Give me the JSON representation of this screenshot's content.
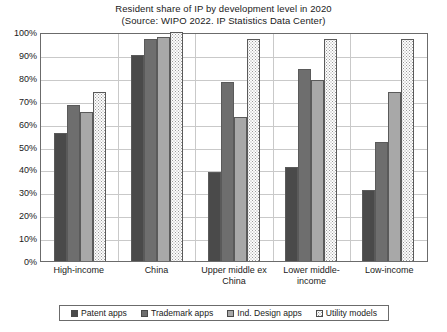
{
  "chart_data": {
    "type": "bar",
    "title": "Resident share of IP by development level in 2020",
    "subtitle": "(Source: WIPO 2022. IP Statistics Data Center)",
    "xlabel": "",
    "ylabel": "",
    "ylim": [
      0,
      100
    ],
    "grid": true,
    "legend_position": "bottom",
    "categories": [
      "High-income",
      "China",
      "Upper middle ex China",
      "Lower middle-income",
      "Low-income"
    ],
    "series": [
      {
        "name": "Patent apps",
        "color": "#4a4a4a",
        "values": [
          56,
          90,
          39,
          41,
          31
        ]
      },
      {
        "name": "Trademark apps",
        "color": "#6e6e6e",
        "values": [
          68,
          97,
          78,
          84,
          52
        ]
      },
      {
        "name": "Ind. Design apps",
        "color": "#a8a8a8",
        "values": [
          65,
          98,
          63,
          79,
          74
        ]
      },
      {
        "name": "Utility models",
        "color": "#fdfdfd",
        "values": [
          74,
          100,
          97,
          97,
          97
        ]
      }
    ],
    "ytick_labels": [
      "100%",
      "90%",
      "80%",
      "70%",
      "60%",
      "50%",
      "40%",
      "30%",
      "20%",
      "10%",
      "0%"
    ],
    "ytick_values": [
      100,
      90,
      80,
      70,
      60,
      50,
      40,
      30,
      20,
      10,
      0
    ]
  }
}
